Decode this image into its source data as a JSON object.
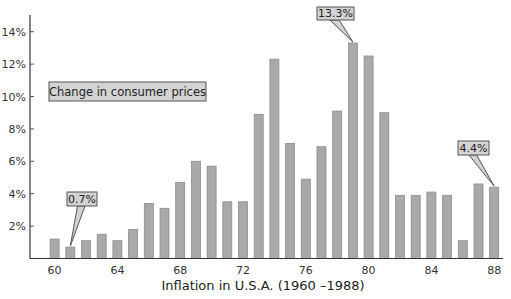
{
  "chart_data": {
    "type": "bar",
    "title": "",
    "xlabel": "Inflation in U.S.A. (1960 –1988)",
    "ylabel": "",
    "legend_box": "Change in consumer prices",
    "ylim": [
      0,
      14
    ],
    "yticks": [
      "2%",
      "4%",
      "6%",
      "8%",
      "10%",
      "12%",
      "14%"
    ],
    "ytick_values": [
      2,
      4,
      6,
      8,
      10,
      12,
      14
    ],
    "xticks": [
      "60",
      "64",
      "68",
      "72",
      "76",
      "80",
      "84",
      "88"
    ],
    "categories": [
      "1960",
      "1961",
      "1962",
      "1963",
      "1964",
      "1965",
      "1966",
      "1967",
      "1968",
      "1969",
      "1970",
      "1971",
      "1972",
      "1973",
      "1974",
      "1975",
      "1976",
      "1977",
      "1978",
      "1979",
      "1980",
      "1981",
      "1982",
      "1983",
      "1984",
      "1985",
      "1986",
      "1987",
      "1988"
    ],
    "values": [
      1.2,
      0.7,
      1.1,
      1.5,
      1.1,
      1.8,
      3.4,
      3.1,
      4.7,
      6.0,
      5.7,
      3.5,
      3.5,
      8.9,
      12.3,
      7.1,
      4.9,
      6.9,
      9.1,
      13.3,
      12.5,
      9.0,
      3.9,
      3.9,
      4.1,
      3.9,
      1.1,
      4.6,
      4.4
    ],
    "annotations": [
      {
        "label": "0.7%",
        "year": "1961",
        "value": 0.7
      },
      {
        "label": "13.3%",
        "year": "1979",
        "value": 13.3
      },
      {
        "label": "4.4%",
        "year": "1988",
        "value": 4.4
      }
    ],
    "grid": false,
    "colors": {
      "bar": "#a9a9a9",
      "bar_border": "#8c8c8c",
      "box": "#d3d3d3",
      "axis": "#333333"
    }
  }
}
